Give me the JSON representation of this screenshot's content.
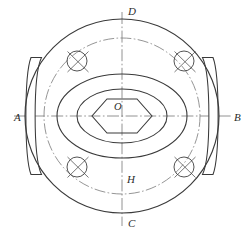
{
  "drawing": {
    "title": "Flange end view technical drawing",
    "type": "engineering-orthographic-view",
    "line_color": "#3a3a3a",
    "centerline_color": "#6e6e6e",
    "background": "#ffffff",
    "center": {
      "x": 122,
      "y": 116,
      "label": "O"
    },
    "labels": {
      "top": "D",
      "bottom": "C",
      "left": "A",
      "right": "B",
      "center": "O",
      "inner_bottom": "H"
    },
    "geometry": {
      "outer_circle": {
        "cx": 122,
        "cy": 116,
        "r": 97
      },
      "bolt_circle": {
        "cx": 122,
        "cy": 116,
        "r": 78,
        "style": "dash-dot"
      },
      "outer_ellipse": {
        "cx": 122,
        "cy": 116,
        "rx": 65,
        "ry": 42
      },
      "inner_ellipse": {
        "cx": 122,
        "cy": 116,
        "rx": 45,
        "ry": 27
      },
      "hexagon": {
        "cx": 122,
        "cy": 116,
        "across_flats": 30,
        "across_corners": 44
      },
      "bolt_holes": [
        {
          "id": "bolt-hole-top-left",
          "cx": 77,
          "cy": 61,
          "r": 10
        },
        {
          "id": "bolt-hole-top-right",
          "cx": 184,
          "cy": 61,
          "r": 10
        },
        {
          "id": "bolt-hole-bottom-left",
          "cx": 77,
          "cy": 167,
          "r": 10
        },
        {
          "id": "bolt-hole-bottom-right",
          "cx": 184,
          "cy": 167,
          "r": 10
        }
      ],
      "lugs": [
        {
          "id": "lug-left",
          "side": "left",
          "y_top": 57,
          "y_bottom": 175
        },
        {
          "id": "lug-right",
          "side": "right",
          "y_top": 57,
          "y_bottom": 175
        }
      ],
      "centerlines": {
        "horizontal": {
          "x1": 14,
          "x2": 232,
          "y": 116
        },
        "vertical": {
          "y1": 12,
          "y2": 226,
          "x": 122
        }
      }
    }
  }
}
